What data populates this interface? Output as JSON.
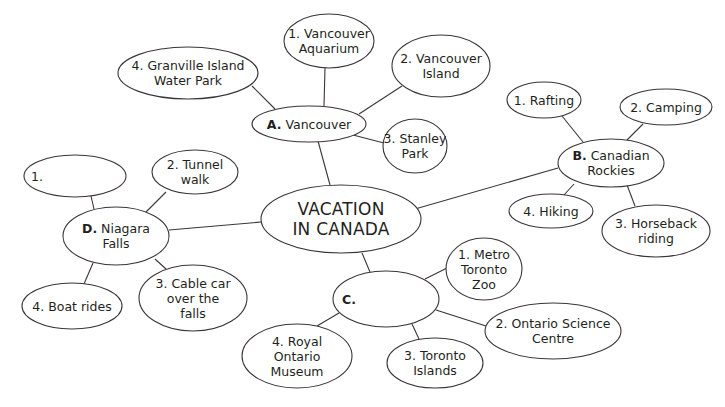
{
  "title": "VACATION IN CANADA",
  "center": {
    "lines": [
      "VACATION",
      "IN CANADA"
    ],
    "cx": 341,
    "cy": 219,
    "rx": 80,
    "ry": 34
  },
  "regions": [
    {
      "id": "A",
      "letter": "A.",
      "name": "Vancouver",
      "lines": [
        "Vancouver"
      ],
      "cx": 309,
      "cy": 124,
      "rx": 57,
      "ry": 18,
      "link": [
        330,
        185,
        318,
        141
      ],
      "activities": [
        {
          "num": "1.",
          "label": "Vancouver Aquarium",
          "lines": [
            "1. Vancouver",
            "Aquarium"
          ],
          "cx": 329,
          "cy": 41,
          "rx": 45,
          "ry": 27,
          "link": [
            325,
            68,
            324,
            106
          ]
        },
        {
          "num": "2.",
          "label": "Vancouver Island",
          "lines": [
            "2. Vancouver",
            "Island"
          ],
          "cx": 441,
          "cy": 66,
          "rx": 49,
          "ry": 31,
          "link": [
            402,
            86,
            359,
            114
          ]
        },
        {
          "num": "3.",
          "label": "Stanley Park",
          "lines": [
            "3. Stanley",
            "Park"
          ],
          "cx": 415,
          "cy": 146,
          "rx": 32,
          "ry": 27,
          "link": [
            384,
            143,
            353,
            135
          ]
        },
        {
          "num": "4.",
          "label": "Granville Island Water Park",
          "lines": [
            "4. Granville Island",
            "Water Park"
          ],
          "cx": 188,
          "cy": 73,
          "rx": 70,
          "ry": 26,
          "link": [
            252,
            86,
            275,
            109
          ]
        }
      ]
    },
    {
      "id": "B",
      "letter": "B.",
      "name": "Canadian Rockies",
      "lines": [
        "Canadian",
        "Rockies"
      ],
      "cx": 611,
      "cy": 163,
      "rx": 53,
      "ry": 24,
      "link": [
        415,
        209,
        558,
        168
      ],
      "activities": [
        {
          "num": "1.",
          "label": "Rafting",
          "lines": [
            "1. Rafting"
          ],
          "cx": 544,
          "cy": 100,
          "rx": 37,
          "ry": 18,
          "link": [
            562,
            116,
            583,
            142
          ]
        },
        {
          "num": "2.",
          "label": "Camping",
          "lines": [
            "2. Camping"
          ],
          "cx": 666,
          "cy": 107,
          "rx": 46,
          "ry": 18,
          "link": [
            643,
            124,
            627,
            140
          ]
        },
        {
          "num": "3.",
          "label": "Horseback riding",
          "lines": [
            "3. Horseback",
            "riding"
          ],
          "cx": 656,
          "cy": 231,
          "rx": 54,
          "ry": 26,
          "link": [
            635,
            206,
            627,
            185
          ]
        },
        {
          "num": "4.",
          "label": "Hiking",
          "lines": [
            "4. Hiking"
          ],
          "cx": 551,
          "cy": 211,
          "rx": 42,
          "ry": 17,
          "link": [
            564,
            195,
            574,
            184
          ]
        }
      ]
    },
    {
      "id": "C",
      "letter": "C.",
      "name": "",
      "lines": [
        ""
      ],
      "cx": 386,
      "cy": 299,
      "rx": 53,
      "ry": 28,
      "link": [
        362,
        253,
        370,
        272
      ],
      "activities": [
        {
          "num": "1.",
          "label": "Metro Toronto Zoo",
          "lines": [
            "1. Metro",
            "Toronto",
            "Zoo"
          ],
          "cx": 484,
          "cy": 269,
          "rx": 38,
          "ry": 31,
          "link": [
            447,
            268,
            425,
            279
          ]
        },
        {
          "num": "2.",
          "label": "Ontario Science Centre",
          "lines": [
            "2. Ontario Science",
            "Centre"
          ],
          "cx": 553,
          "cy": 331,
          "rx": 68,
          "ry": 28,
          "link": [
            486,
            326,
            436,
            310
          ]
        },
        {
          "num": "3.",
          "label": "Toronto Islands",
          "lines": [
            "3. Toronto",
            "Islands"
          ],
          "cx": 435,
          "cy": 363,
          "rx": 48,
          "ry": 25,
          "link": [
            419,
            339,
            412,
            324
          ]
        },
        {
          "num": "4.",
          "label": "Royal Ontario Museum",
          "lines": [
            "4. Royal",
            "Ontario",
            "Museum"
          ],
          "cx": 297,
          "cy": 356,
          "rx": 55,
          "ry": 32,
          "link": [
            317,
            326,
            339,
            313
          ]
        }
      ]
    },
    {
      "id": "D",
      "letter": "D.",
      "name": "Niagara Falls",
      "lines": [
        "Niagara",
        "Falls"
      ],
      "cx": 116,
      "cy": 236,
      "rx": 53,
      "ry": 29,
      "link": [
        261,
        222,
        169,
        230
      ],
      "activities": [
        {
          "num": "1.",
          "label": "",
          "lines": [
            "1."
          ],
          "cx": 75,
          "cy": 176,
          "rx": 51,
          "ry": 21,
          "link": [
            91,
            196,
            94,
            209
          ]
        },
        {
          "num": "2.",
          "label": "Tunnel walk",
          "lines": [
            "2. Tunnel",
            "walk"
          ],
          "cx": 195,
          "cy": 172,
          "rx": 43,
          "ry": 22,
          "link": [
            166,
            192,
            146,
            212
          ]
        },
        {
          "num": "3.",
          "label": "Cable car over the falls",
          "lines": [
            "3. Cable car",
            "over the",
            "falls"
          ],
          "cx": 193,
          "cy": 298,
          "rx": 54,
          "ry": 33,
          "link": [
            166,
            269,
            155,
            259
          ]
        },
        {
          "num": "4.",
          "label": "Boat rides",
          "lines": [
            "4. Boat rides"
          ],
          "cx": 72,
          "cy": 306,
          "rx": 50,
          "ry": 23,
          "link": [
            84,
            284,
            93,
            263
          ]
        }
      ]
    }
  ],
  "colors": {
    "stroke": "#3a3536",
    "text": "#231f20",
    "background": "#ffffff"
  }
}
